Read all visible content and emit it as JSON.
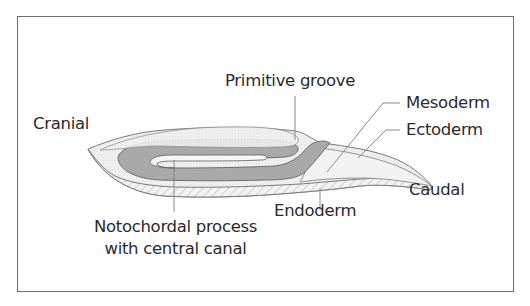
{
  "diagram": {
    "type": "embryo-sagittal-section",
    "labels": {
      "cranial": "Cranial",
      "primitive_groove": "Primitive groove",
      "mesoderm": "Mesoderm",
      "ectoderm": "Ectoderm",
      "caudal": "Caudal",
      "endoderm": "Endoderm",
      "notochordal_line1": "Notochordal process",
      "notochordal_line2": "with central canal"
    },
    "colors": {
      "frame": "#6e6e6e",
      "ectoderm_fill": "#ededed",
      "notochord_fill": "#a9a9a9",
      "endoderm_hatch": "#d6d6d6",
      "outline": "#7a7a7a",
      "leader": "#8a8a8a",
      "text": "#2a2a2a"
    }
  }
}
